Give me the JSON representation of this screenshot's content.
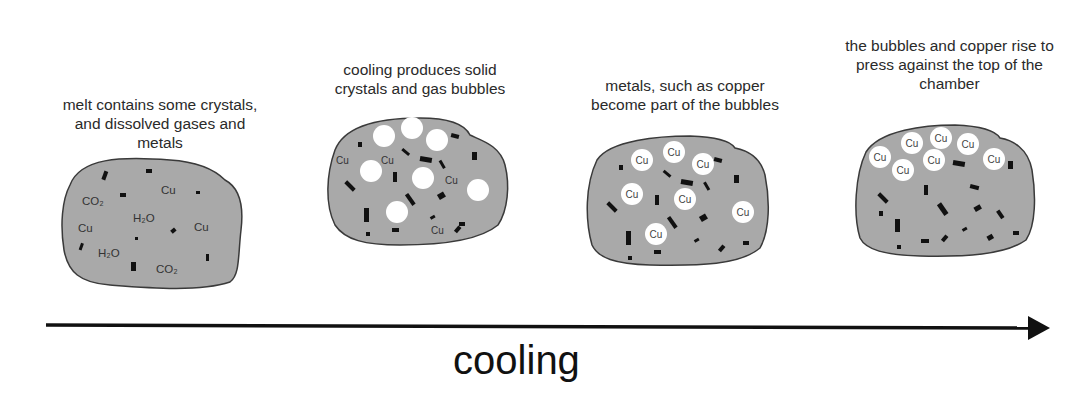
{
  "stages": [
    {
      "caption": "melt contains some crystals, and dissolved gases and metals",
      "labels": {
        "co2_a": "CO₂",
        "cu_a": "Cu",
        "h2o_a": "H₂O",
        "cu_b": "Cu",
        "cu_c": "Cu",
        "h2o_b": "H₂O",
        "co2_b": "CO₂"
      }
    },
    {
      "caption": "cooling produces solid crystals and gas bubbles",
      "labels": {
        "cu_a": "Cu",
        "cu_b": "Cu",
        "cu_c": "Cu",
        "cu_d": "Cu"
      }
    },
    {
      "caption": "metals, such as copper become part of the bubbles",
      "bubble_label": "Cu"
    },
    {
      "caption": "the bubbles and copper rise to press against the top of the chamber",
      "bubble_label": "Cu"
    }
  ],
  "axis": {
    "label": "cooling"
  },
  "colors": {
    "melt": "#a9a9a9",
    "outline": "#3a3a3a",
    "crystal": "#111111",
    "bubble": "#ffffff"
  }
}
